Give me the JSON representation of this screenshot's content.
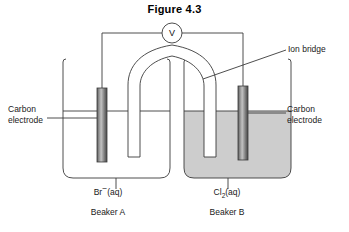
{
  "figure": {
    "title": "Figure 4.3",
    "type": "electrochemical-cell-diagram"
  },
  "meter": {
    "symbol": "V",
    "name": "voltmeter"
  },
  "labels": {
    "carbon_electrode_left_line1": "Carbon",
    "carbon_electrode_left_line2": "electrode",
    "carbon_electrode_right_line1": "Carbon",
    "carbon_electrode_right_line2": "electrode",
    "ion_bridge": "Ion bridge"
  },
  "beakers": [
    {
      "id": "A",
      "name": "Beaker A",
      "solution_formula": "Br",
      "solution_charge": "−",
      "solution_state": "(aq)",
      "filled": false
    },
    {
      "id": "B",
      "name": "Beaker B",
      "solution_formula": "Cl",
      "solution_subscript": "2",
      "solution_state": "(aq)",
      "filled": true
    }
  ],
  "colors": {
    "stroke": "#3a3a3a",
    "text": "#1a1a1a",
    "liquid_fill": "#cdcdcd",
    "electrode_dark": "#4a4a4a",
    "electrode_light": "#b6b6b6",
    "background": "#ffffff"
  }
}
